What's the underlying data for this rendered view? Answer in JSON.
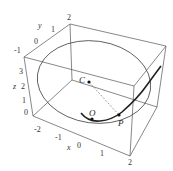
{
  "figure": {
    "type": "3d-plot",
    "axes": {
      "x": {
        "label": "x",
        "ticks": [
          "-2",
          "-1",
          "0",
          "1",
          "2"
        ]
      },
      "y": {
        "label": "y",
        "ticks": [
          "-1",
          "0",
          "1",
          "2"
        ]
      },
      "z": {
        "label": "z",
        "ticks": [
          "0",
          "1",
          "2",
          "3"
        ]
      }
    },
    "points": [
      {
        "name": "C",
        "role": "center of curvature"
      },
      {
        "name": "O",
        "role": "origin"
      },
      {
        "name": "P",
        "role": "point on curve"
      }
    ],
    "colors": {
      "box": "#555555",
      "circle": "#444444",
      "curve": "#222222",
      "dashed": "#777777",
      "labels": "#333333"
    }
  }
}
